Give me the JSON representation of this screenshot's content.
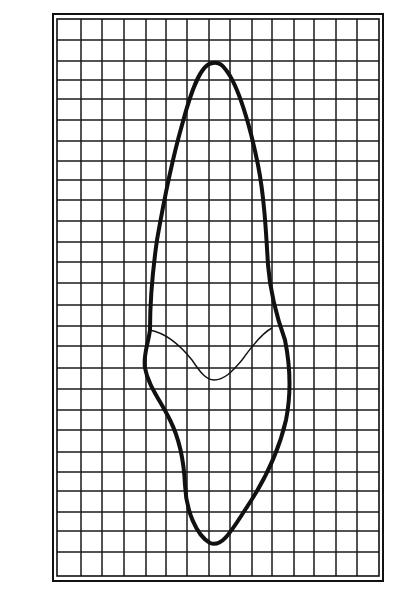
{
  "figure": {
    "colors": {
      "background": "#ffffff",
      "ink": "#111111",
      "grid": "#1a1a1a"
    },
    "frame": {
      "outer": {
        "x": 53,
        "y": 14,
        "w": 330,
        "h": 567
      },
      "inner": {
        "x": 57,
        "y": 19,
        "w": 322,
        "h": 557
      }
    },
    "grid": {
      "columns": 15,
      "rows": 27,
      "x_lines": [
        81,
        102,
        124,
        146,
        166,
        187,
        209,
        230,
        252,
        272,
        294,
        314,
        336,
        357
      ],
      "y_lines": [
        40,
        61,
        80,
        99,
        120,
        141,
        161,
        180,
        200,
        221,
        242,
        262,
        283,
        305,
        326,
        346,
        368,
        389,
        410,
        430,
        452,
        472,
        491,
        512,
        531,
        552
      ]
    },
    "outline": {
      "label": "tooth-outline",
      "stroke_width": 4,
      "path": "M213,63 C200,63 190,95 182,125 C172,160 164,200 157,240 C152,275 150,305 150,330 C148,345 143,355 145,368 C148,385 160,400 170,420 C180,440 184,462 185,485 C186,510 196,535 210,543 C222,548 232,530 245,510 C262,485 278,455 286,420 C292,390 290,365 285,340 C276,315 270,290 268,265 C266,230 264,195 258,165 C250,125 238,85 226,70 C222,64 217,62 213,63 Z"
    },
    "cej_line": {
      "label": "crown-root-junction-line",
      "stroke_width": 1.4,
      "path": "M150,330 C165,333 180,345 192,360 C200,372 206,380 214,380 C224,380 232,372 242,360 C252,346 262,333 272,328"
    }
  }
}
